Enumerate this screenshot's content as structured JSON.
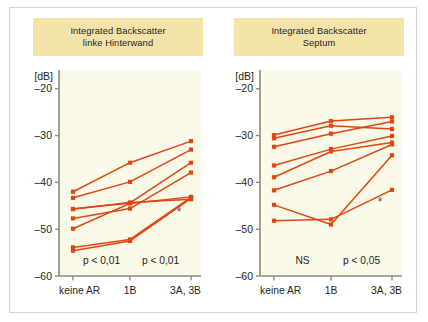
{
  "figure": {
    "background": "#ffffff",
    "frame_color": "#d6d4cf",
    "plot_background": "#fbf9e7",
    "title_background": "#f4e3a8",
    "series_color": "#e04512",
    "axis_color": "#8d8a80",
    "text_color": "#231f1c"
  },
  "chart_data": [
    {
      "type": "line",
      "panel_id": "left",
      "title": "Integrated Backscatter",
      "subtitle": "linke Hinterwand",
      "title_lines": [
        "Integrated Backscatter",
        "linke Hinterwand"
      ],
      "xlabel": "",
      "ylabel": "[dB]",
      "unit_label": "[dB]",
      "categories": [
        "keine AR",
        "1B",
        "3A, 3B"
      ],
      "yticks": [
        -20,
        -30,
        -40,
        -50,
        -60
      ],
      "ytick_labels": [
        "–20",
        "–30",
        "–40",
        "–50",
        "–60"
      ],
      "ylim": [
        -60,
        -16
      ],
      "grid": false,
      "legend": "none",
      "marker": "square",
      "annotations": [
        {
          "text": "p < 0,01",
          "x_between": [
            "keine AR",
            "1B"
          ],
          "y": -57.5
        },
        {
          "text": "p < 0,01",
          "x_between": [
            "1B",
            "3A, 3B"
          ],
          "y": -57.5
        },
        {
          "text": "*",
          "x": "3A, 3B",
          "y": -47.2,
          "role": "significance-star"
        }
      ],
      "series": [
        {
          "name": "subject-1",
          "values": [
            -42.0,
            -35.8,
            -31.2
          ]
        },
        {
          "name": "subject-2",
          "values": [
            -43.3,
            -39.9,
            -33.0
          ]
        },
        {
          "name": "subject-3",
          "values": [
            -45.7,
            -44.4,
            -35.8
          ]
        },
        {
          "name": "subject-4",
          "values": [
            -47.7,
            -45.6,
            -37.9
          ]
        },
        {
          "name": "subject-5",
          "values": [
            -49.9,
            -44.5,
            -43.1
          ]
        },
        {
          "name": "subject-6",
          "values": [
            -53.9,
            -52.2,
            -43.2
          ]
        },
        {
          "name": "subject-7",
          "values": [
            -54.6,
            -52.5,
            -43.4
          ]
        },
        {
          "name": "subject-8",
          "values": [
            -45.7,
            -44.3,
            -43.6
          ]
        }
      ]
    },
    {
      "type": "line",
      "panel_id": "right",
      "title": "Integrated Backscatter",
      "subtitle": "Septum",
      "title_lines": [
        "Integrated Backscatter",
        "Septum"
      ],
      "xlabel": "",
      "ylabel": "[dB]",
      "unit_label": "[dB]",
      "categories": [
        "keine AR",
        "1B",
        "3A, 3B"
      ],
      "yticks": [
        -20,
        -30,
        -40,
        -50,
        -60
      ],
      "ytick_labels": [
        "–20",
        "–30",
        "–40",
        "–50",
        "–60"
      ],
      "ylim": [
        -60,
        -16
      ],
      "grid": false,
      "legend": "none",
      "marker": "square",
      "annotations": [
        {
          "text": "NS",
          "x_between": [
            "keine AR",
            "1B"
          ],
          "y": -57.5
        },
        {
          "text": "p < 0,05",
          "x_between": [
            "1B",
            "3A, 3B"
          ],
          "y": -57.5
        },
        {
          "text": "*",
          "x": "3A, 3B",
          "y": -45.0,
          "role": "significance-star"
        }
      ],
      "series": [
        {
          "name": "subject-1",
          "values": [
            -29.9,
            -26.9,
            -26.1
          ]
        },
        {
          "name": "subject-2",
          "values": [
            -30.6,
            -27.9,
            -28.6
          ]
        },
        {
          "name": "subject-3",
          "values": [
            -32.4,
            -29.6,
            -27.0
          ]
        },
        {
          "name": "subject-4",
          "values": [
            -36.4,
            -32.9,
            -30.1
          ]
        },
        {
          "name": "subject-5",
          "values": [
            -38.9,
            -33.4,
            -31.5
          ]
        },
        {
          "name": "subject-6",
          "values": [
            -41.7,
            -37.6,
            -31.9
          ]
        },
        {
          "name": "subject-7",
          "values": [
            -44.8,
            -49.0,
            -34.2
          ]
        },
        {
          "name": "subject-8",
          "values": [
            -48.2,
            -47.9,
            -41.6
          ]
        }
      ]
    }
  ]
}
